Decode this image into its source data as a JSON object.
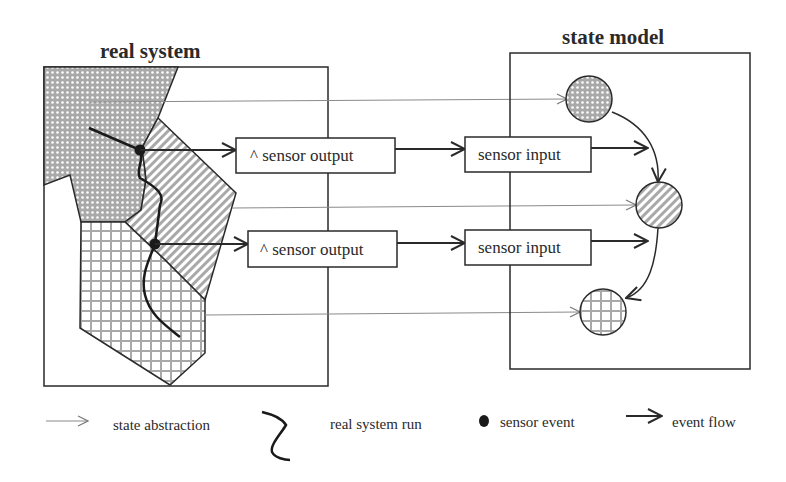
{
  "titles": {
    "real_system": "real system",
    "state_model": "state model"
  },
  "rows": [
    {
      "sensor_output_label": "^ sensor output",
      "sensor_input_label": "sensor input"
    },
    {
      "sensor_output_label": "^ sensor output",
      "sensor_input_label": "sensor input"
    }
  ],
  "legend": [
    {
      "icon": "thin-arrow-icon",
      "label": "state abstraction"
    },
    {
      "icon": "squiggle-icon",
      "label": "real system run"
    },
    {
      "icon": "filled-dot-icon",
      "label": "sensor event"
    },
    {
      "icon": "bold-arrow-icon",
      "label": "event flow"
    }
  ],
  "colors": {
    "stroke": "#2a2a2a",
    "region_fill": "#b8b8b8",
    "thin_line": "#8a8a8a",
    "background": "#ffffff"
  }
}
